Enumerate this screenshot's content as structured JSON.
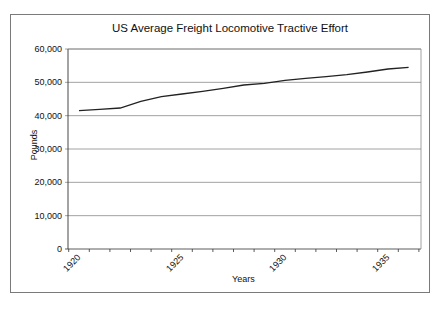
{
  "chart_data": {
    "type": "line",
    "title": "US Average Freight Locomotive Tractive Effort",
    "xlabel": "Years",
    "ylabel": "Pounds",
    "ylim": [
      0,
      60000
    ],
    "yticks": [
      "0",
      "10,000",
      "20,000",
      "30,000",
      "40,000",
      "50,000",
      "60,000"
    ],
    "xtick_labels": [
      "1920",
      "1925",
      "1930",
      "1935"
    ],
    "grid": "horizontal",
    "legend": null,
    "x": [
      1920,
      1921,
      1922,
      1923,
      1924,
      1925,
      1926,
      1927,
      1928,
      1929,
      1930,
      1931,
      1932,
      1933,
      1934,
      1935,
      1936
    ],
    "series": [
      {
        "name": "Average Tractive Effort",
        "color": "#222222",
        "values": [
          41500,
          41900,
          42300,
          44300,
          45700,
          46500,
          47300,
          48200,
          49200,
          49700,
          50600,
          51200,
          51700,
          52300,
          53100,
          54000,
          54500
        ]
      }
    ]
  },
  "labels": {
    "title": "US Average Freight Locomotive Tractive Effort",
    "xlabel": "Years",
    "ylabel": "Pounds"
  }
}
